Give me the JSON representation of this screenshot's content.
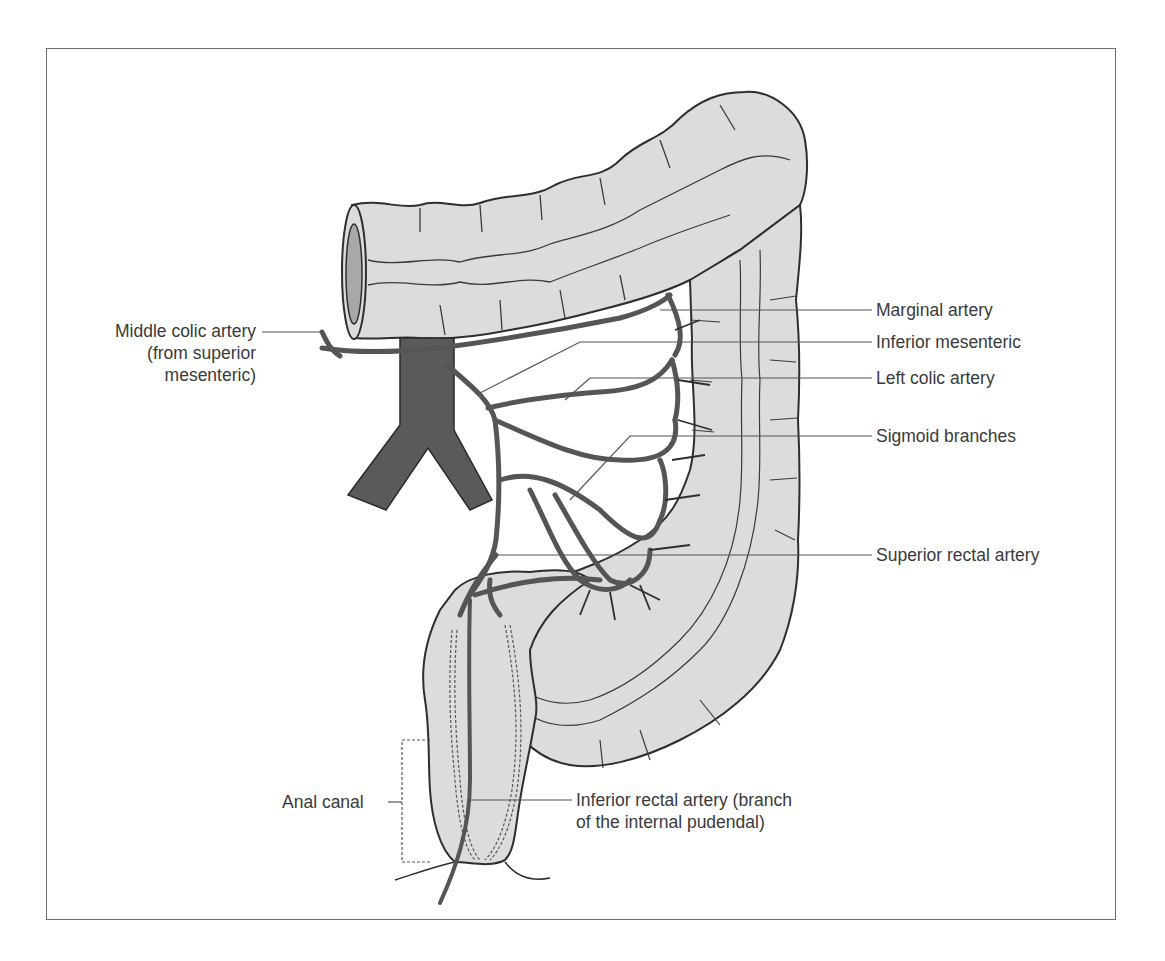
{
  "figure": {
    "colors": {
      "colon_fill": "#dcdcdc",
      "outline": "#2e2e2e",
      "artery": "#555555",
      "aorta": "#5a5a5a",
      "leader_line": "#555555",
      "text": "#3a3a3a",
      "frame": "#6e6e6e"
    }
  },
  "labels": {
    "middle_colic": [
      "Middle colic artery",
      "(from superior",
      "mesenteric)"
    ],
    "marginal": "Marginal artery",
    "inferior_mesenteric": "Inferior mesenteric",
    "left_colic": "Left colic artery",
    "sigmoid": "Sigmoid branches",
    "superior_rectal": "Superior rectal artery",
    "anal_canal": "Anal canal",
    "inferior_rectal": [
      "Inferior rectal artery (branch",
      "of the internal pudendal)"
    ]
  }
}
